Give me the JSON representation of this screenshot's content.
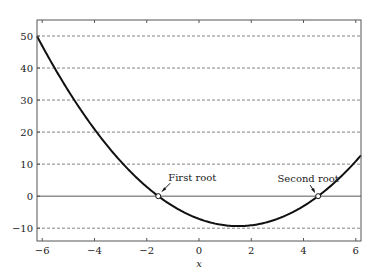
{
  "chart_data": {
    "type": "line",
    "title": "",
    "xlabel": "x",
    "ylabel": "",
    "xlim": [
      -6.2,
      6.2
    ],
    "ylim": [
      -14,
      55
    ],
    "x_ticks": [
      -6,
      -4,
      -2,
      0,
      2,
      4,
      6
    ],
    "x_tick_labels": [
      "−6",
      "−4",
      "−2",
      "0",
      "2",
      "4",
      "6"
    ],
    "y_ticks": [
      -10,
      0,
      10,
      20,
      30,
      40,
      50
    ],
    "y_tick_labels": [
      "−10",
      "0",
      "10",
      "20",
      "30",
      "40",
      "50"
    ],
    "grid": "horizontal dashed",
    "series": [
      {
        "name": "f(x)",
        "function": "x^2 - 3x - 7.1",
        "x": [
          -6.2,
          -6,
          -5,
          -4,
          -3,
          -2,
          -1.56,
          -1,
          0,
          1,
          1.5,
          2,
          3,
          4,
          4.56,
          5,
          6,
          6.2
        ],
        "values": [
          49.9,
          46.9,
          32.9,
          20.9,
          10.9,
          2.9,
          0,
          -3.1,
          -7.1,
          -9.1,
          -9.35,
          -9.1,
          -7.1,
          -3.1,
          0,
          2.9,
          10.9,
          12.9
        ]
      }
    ],
    "annotations": [
      {
        "text": "First root",
        "x": -1.56,
        "y": 0
      },
      {
        "text": "Second root",
        "x": 4.56,
        "y": 0
      }
    ]
  },
  "labels": {
    "xlabel": "x",
    "first_root": "First root",
    "second_root": "Second root"
  },
  "colors": {
    "curve": "#111111",
    "axis": "#555555",
    "grid": "#666666"
  }
}
